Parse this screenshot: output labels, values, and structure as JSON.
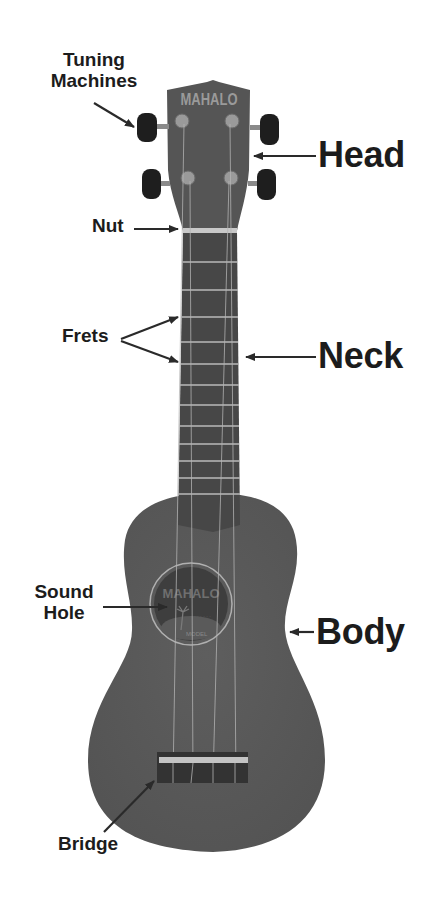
{
  "diagram": {
    "brand_marking": "MAHALO",
    "colors": {
      "background": "#ffffff",
      "body": "#595959",
      "fretboard": "#474747",
      "frets": "#b8b8b8",
      "nut": "#c8c8c8",
      "tuner_buttons": "#1e1e1e",
      "text": "#1c1c1c",
      "arrows": "#2a2a2a"
    },
    "labels": {
      "tuning_machines_line1": "Tuning",
      "tuning_machines_line2": "Machines",
      "head": "Head",
      "nut": "Nut",
      "frets": "Frets",
      "neck": "Neck",
      "sound_hole_line1": "Sound",
      "sound_hole_line2": "Hole",
      "body": "Body",
      "bridge": "Bridge"
    },
    "headstock_logo": "MAHALO",
    "soundhole_label_logo": "MAHALO"
  }
}
